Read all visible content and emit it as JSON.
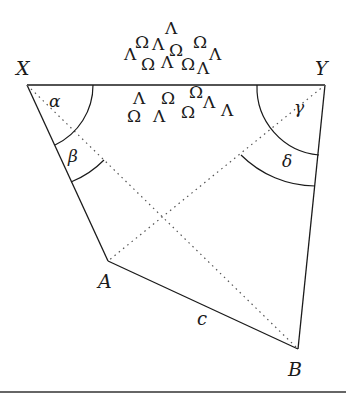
{
  "diagram": {
    "vertices": {
      "X": {
        "label": "X",
        "x": 27,
        "y": 85
      },
      "Y": {
        "label": "Y",
        "x": 325,
        "y": 85
      },
      "A": {
        "label": "A",
        "x": 108,
        "y": 261
      },
      "B": {
        "label": "B",
        "x": 298,
        "y": 349
      }
    },
    "side_labels": {
      "c": "c"
    },
    "angle_labels": {
      "alpha": "α",
      "beta": "β",
      "gamma": "γ",
      "delta": "δ"
    },
    "symbols_above": [
      {
        "char": "Λ",
        "x": 172,
        "y": 34
      },
      {
        "char": "Ω",
        "x": 142,
        "y": 48
      },
      {
        "char": "Λ",
        "x": 159,
        "y": 50
      },
      {
        "char": "Ω",
        "x": 200,
        "y": 48
      },
      {
        "char": "Λ",
        "x": 131,
        "y": 60
      },
      {
        "char": "Ω",
        "x": 176,
        "y": 56
      },
      {
        "char": "Λ",
        "x": 216,
        "y": 60
      },
      {
        "char": "Ω",
        "x": 148,
        "y": 70
      },
      {
        "char": "Λ",
        "x": 168,
        "y": 68
      },
      {
        "char": "Ω",
        "x": 188,
        "y": 70
      },
      {
        "char": "Λ",
        "x": 204,
        "y": 74
      }
    ],
    "symbols_below": [
      {
        "char": "Λ",
        "x": 140,
        "y": 104
      },
      {
        "char": "Ω",
        "x": 168,
        "y": 104
      },
      {
        "char": "Ω",
        "x": 196,
        "y": 98
      },
      {
        "char": "Λ",
        "x": 210,
        "y": 108
      },
      {
        "char": "Ω",
        "x": 134,
        "y": 122
      },
      {
        "char": "Λ",
        "x": 160,
        "y": 122
      },
      {
        "char": "Ω",
        "x": 188,
        "y": 118
      },
      {
        "char": "Λ",
        "x": 228,
        "y": 116
      }
    ]
  }
}
